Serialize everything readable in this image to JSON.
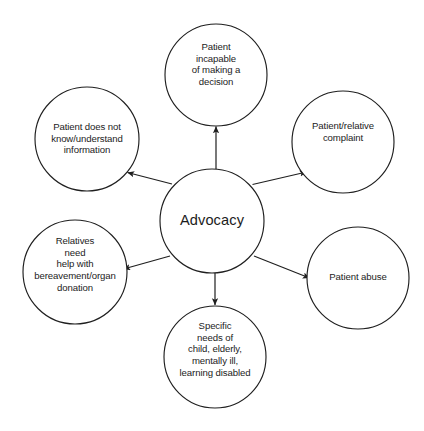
{
  "diagram": {
    "type": "hub-and-spoke concept map",
    "center": {
      "id": "advocacy",
      "label": "Advocacy",
      "cx": 212,
      "cy": 221,
      "r": 52
    },
    "stroke_color": "#1f1f1f",
    "text_color": "#1c1c1c",
    "background_color": "#ffffff",
    "satellites": [
      {
        "id": "incapable-decision",
        "label": "Patient\nincapable\nof making a\ndecision",
        "cx": 216,
        "cy": 75,
        "r": 51,
        "label_width": 86,
        "arrow_direction": "outward-up"
      },
      {
        "id": "patient-relative-complaint",
        "label": "Patient/relative\ncomplaint",
        "cx": 343,
        "cy": 142,
        "r": 51,
        "label_width": 92,
        "arrow_direction": "outward-upper-right"
      },
      {
        "id": "patient-abuse",
        "label": "Patient abuse",
        "cx": 358,
        "cy": 278,
        "r": 51,
        "label_width": 92,
        "arrow_direction": "outward-lower-right"
      },
      {
        "id": "specific-needs",
        "label": "Specific\nneeds of\nchild, elderly,\nmentally ill,\nlearning disabled",
        "cx": 215,
        "cy": 357,
        "r": 51,
        "label_width": 96,
        "arrow_direction": "outward-down"
      },
      {
        "id": "bereavement-organ-donation",
        "label": "Relatives\nneed\nhelp with\nbereavement/organ\ndonation",
        "cx": 75,
        "cy": 272,
        "r": 52,
        "label_width": 100,
        "arrow_direction": "outward-lower-left"
      },
      {
        "id": "does-not-understand",
        "label": "Patient does not\nknow/understand\ninformation",
        "cx": 87,
        "cy": 139,
        "r": 52,
        "label_width": 98,
        "arrow_direction": "outward-upper-left"
      }
    ]
  }
}
